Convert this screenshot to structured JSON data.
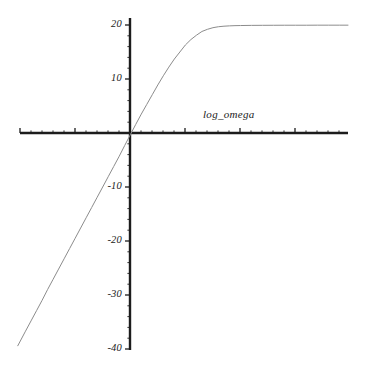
{
  "figure": {
    "background_color": "#ffffff",
    "width": 370,
    "height": 370
  },
  "axis_label": {
    "text": "log_omega",
    "position": "above-x-axis-right-of-origin"
  },
  "axes": {
    "x_axis_color": "#1c1c1c",
    "y_axis_color": "#1c1c1c",
    "origin_px": [
      130,
      133
    ],
    "x_axis_start_px": 20,
    "x_axis_end_px": 348,
    "y_axis_top_px": 18,
    "y_axis_bottom_px": 350,
    "y_px_per_unit": 5.4,
    "x_major_tick_spacing_px": 55,
    "x_minor_ticks_per_major": 5,
    "y_major_tick_spacing_px": 54,
    "y_minor_ticks_per_major": 5
  },
  "chart_data": {
    "type": "line",
    "title": "",
    "xlabel": "log_omega",
    "ylabel": "",
    "grid": false,
    "legend": null,
    "xlim": [
      -2.0,
      3.95
    ],
    "ylim": [
      -41.5,
      21.5
    ],
    "x_tick_labels": [],
    "y_tick_labels": [
      "20",
      "10",
      "-10",
      "-20",
      "-30",
      "-40"
    ],
    "y_ticks": [
      20,
      10,
      -10,
      -20,
      -30,
      -40
    ],
    "series": [
      {
        "name": "magnitude",
        "color": "#8c8c8c",
        "line_width": 1,
        "description": "Linear ramp in log_omega saturating at 20",
        "x": [
          -2.04,
          -1.9,
          -1.8,
          -1.7,
          -1.6,
          -1.5,
          -1.4,
          -1.3,
          -1.2,
          -1.1,
          -1.0,
          -0.9,
          -0.8,
          -0.7,
          -0.6,
          -0.5,
          -0.4,
          -0.3,
          -0.2,
          -0.1,
          0.0,
          0.1,
          0.2,
          0.3,
          0.4,
          0.5,
          0.6,
          0.7,
          0.8,
          0.9,
          1.0,
          1.1,
          1.2,
          1.3,
          1.4,
          1.5,
          1.6,
          1.7,
          1.8,
          1.9,
          2.0,
          2.2,
          2.4,
          2.6,
          2.8,
          3.0,
          3.2,
          3.4,
          3.6,
          3.8,
          3.95
        ],
        "y": [
          -39.4,
          -36.7,
          -34.8,
          -32.9,
          -31.0,
          -29.0,
          -27.1,
          -25.2,
          -23.3,
          -21.4,
          -19.5,
          -17.6,
          -15.7,
          -13.8,
          -11.9,
          -10.0,
          -8.1,
          -6.2,
          -4.3,
          -2.3,
          -0.35,
          1.6,
          3.5,
          5.3,
          7.1,
          8.9,
          10.6,
          12.2,
          13.7,
          15.0,
          16.3,
          17.3,
          18.1,
          18.8,
          19.2,
          19.5,
          19.68,
          19.78,
          19.84,
          19.88,
          19.9,
          19.93,
          19.94,
          19.95,
          19.96,
          19.96,
          19.96,
          19.97,
          19.97,
          19.97,
          19.97
        ]
      }
    ]
  }
}
